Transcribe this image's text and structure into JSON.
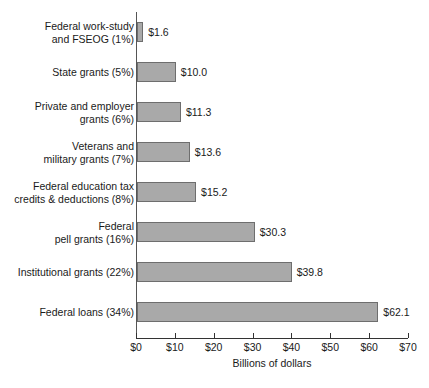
{
  "chart_data": {
    "type": "bar",
    "orientation": "horizontal",
    "title": "",
    "xlabel": "Billions of dollars",
    "ylabel": "",
    "xlim": [
      0,
      70
    ],
    "grid": false,
    "legend": null,
    "xticks": [
      "$0",
      "$10",
      "$20",
      "$30",
      "$40",
      "$50",
      "$60",
      "$70"
    ],
    "xtick_values": [
      0,
      10,
      20,
      30,
      40,
      50,
      60,
      70
    ],
    "categories": [
      "Federal work-study\nand FSEOG (1%)",
      "State grants (5%)",
      "Private and employer\ngrants (6%)",
      "Veterans and\nmilitary grants (7%)",
      "Federal education tax\ncredits & deductions (8%)",
      "Federal\npell grants (16%)",
      "Institutional grants (22%)",
      "Federal loans (34%)"
    ],
    "values": [
      1.6,
      10.0,
      11.3,
      13.6,
      15.2,
      30.3,
      39.8,
      62.1
    ],
    "value_labels": [
      "$1.6",
      "$10.0",
      "$11.3",
      "$13.6",
      "$15.2",
      "$30.3",
      "$39.8",
      "$62.1"
    ],
    "shares": [
      "1%",
      "5%",
      "6%",
      "7%",
      "8%",
      "16%",
      "22%",
      "34%"
    ],
    "bar_color": "#a9a9a9",
    "bar_edge_color": "#6e6e6e",
    "axis_color": "#333333",
    "background": "#ffffff"
  }
}
